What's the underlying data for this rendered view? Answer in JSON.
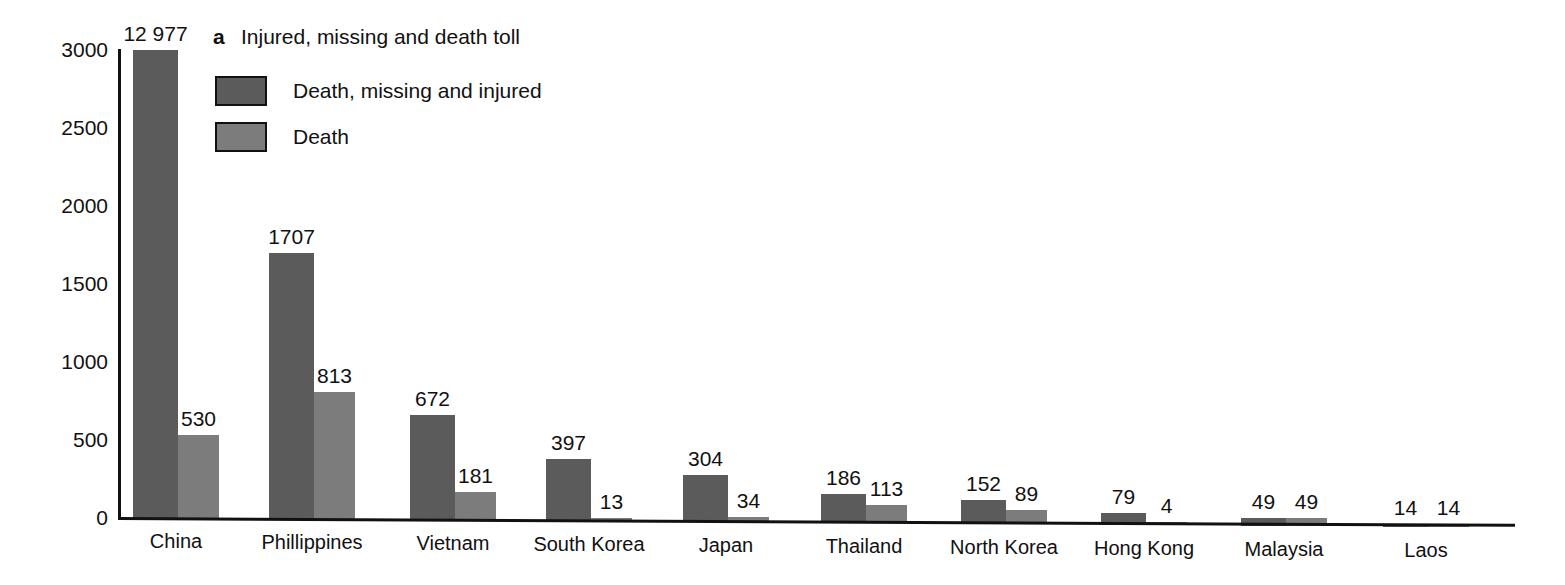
{
  "panel": {
    "letter": "a",
    "title": "Injured, missing and death toll"
  },
  "legend": {
    "items": [
      {
        "label": "Death, missing and injured",
        "color": "#5b5b5b",
        "key": "total"
      },
      {
        "label": "Death",
        "color": "#7c7c7c",
        "key": "death"
      }
    ]
  },
  "axis": {
    "y_ticks": [
      "0",
      "500",
      "1000",
      "1500",
      "2000",
      "2500",
      "3000"
    ],
    "y_tick_values": [
      0,
      500,
      1000,
      1500,
      2000,
      2500,
      3000
    ],
    "y_label": "",
    "x_label": ""
  },
  "chart_data": {
    "type": "bar",
    "title": "Injured, missing and death toll",
    "xlabel": "",
    "ylabel": "",
    "ylim": [
      0,
      3000
    ],
    "grid": false,
    "legend_position": "top-left",
    "note": "China 'Death, missing and injured' bar is clipped at the 3000 axis maximum; its true value is 12 977.",
    "categories": [
      "China",
      "Phillippines",
      "Vietnam",
      "South Korea",
      "Japan",
      "Thailand",
      "North Korea",
      "Hong Kong",
      "Malaysia",
      "Laos"
    ],
    "series": [
      {
        "name": "Death, missing and injured",
        "color": "#5b5b5b",
        "values": [
          12977,
          1707,
          672,
          397,
          304,
          186,
          152,
          79,
          49,
          14
        ],
        "labels": [
          "12 977",
          "1707",
          "672",
          "397",
          "304",
          "186",
          "152",
          "79",
          "49",
          "14"
        ]
      },
      {
        "name": "Death",
        "color": "#7c7c7c",
        "values": [
          530,
          813,
          181,
          13,
          34,
          113,
          89,
          4,
          49,
          14
        ],
        "labels": [
          "530",
          "813",
          "181",
          "13",
          "34",
          "113",
          "89",
          "4",
          "49",
          "14"
        ]
      }
    ]
  }
}
